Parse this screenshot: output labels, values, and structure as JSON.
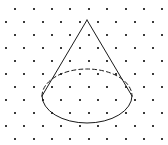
{
  "figure": {
    "width": 168,
    "height": 145,
    "background_color": "#ffffff"
  },
  "grid": {
    "name": "staggered-dot-grid",
    "dot_color": "#3a3a3a",
    "dot_size": 2,
    "column_spacing": 18.4,
    "row_spacing": 13.2,
    "stagger_offset": 9.2,
    "rows": [
      {
        "y": 9,
        "offset": 9.2,
        "count": 9
      },
      {
        "y": 22,
        "offset": 0,
        "count": 10
      },
      {
        "y": 35,
        "offset": 9.2,
        "count": 9
      },
      {
        "y": 48,
        "offset": 0,
        "count": 10
      },
      {
        "y": 61,
        "offset": 9.2,
        "count": 9
      },
      {
        "y": 74,
        "offset": 0,
        "count": 10
      },
      {
        "y": 87,
        "offset": 9.2,
        "count": 9
      },
      {
        "y": 100,
        "offset": 0,
        "count": 10
      },
      {
        "y": 113,
        "offset": 9.2,
        "count": 9
      },
      {
        "y": 126,
        "offset": 0,
        "count": 10
      },
      {
        "y": 139,
        "offset": 9.2,
        "count": 9
      }
    ],
    "first_column_x": 6
  },
  "cone": {
    "name": "cone-figure",
    "stroke_color": "#1a1a1a",
    "stroke_width": 1,
    "apex": {
      "x": 87,
      "y": 20
    },
    "base_ellipse": {
      "cx": 87,
      "cy": 96,
      "rx": 45,
      "ry": 27
    },
    "left_slant": {
      "x1": 87,
      "y1": 20,
      "x2": 42,
      "y2": 96
    },
    "right_slant": {
      "x1": 87,
      "y1": 20,
      "x2": 132,
      "y2": 96
    },
    "front_arc_path": "M 42 96 A 45 27 0 0 0 132 96",
    "hidden_arc_path": "M 42 96 A 45 27 0 0 1 132 96",
    "hidden_arc_style": "dashed",
    "hidden_arc_dash_pattern": "4 3",
    "visible_arc_style": "solid"
  }
}
